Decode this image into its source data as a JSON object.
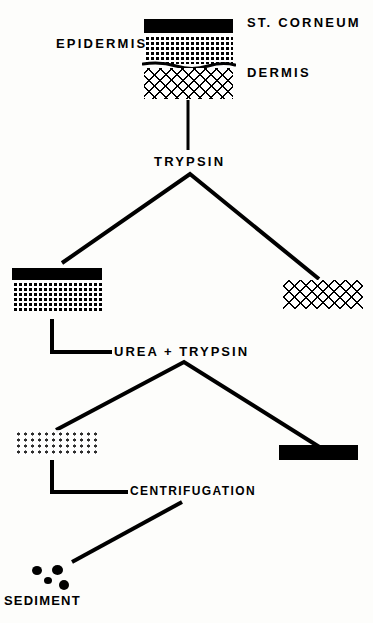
{
  "figure": {
    "type": "flow-diagram",
    "background_color": "#fdfdfb",
    "ink_color": "#000000"
  },
  "labels": {
    "st_corneum": "ST. CORNEUM",
    "epidermis": "EPIDERMIS",
    "dermis": "DERMIS",
    "trypsin": "TRYPSIN",
    "urea_trypsin": "UREA + TRYPSIN",
    "centrifugation": "CENTRIFUGATION",
    "sediment": "SEDIMENT"
  },
  "specimens": {
    "skin_full": {
      "name": "full-thickness-skin",
      "layers": [
        "stratum corneum (solid black)",
        "epidermis (dotted)",
        "dermis (cross-hatched)"
      ]
    },
    "epidermis_sheet": {
      "name": "separated-epidermis",
      "layers": [
        "stratum corneum (solid black)",
        "epidermis (dotted)"
      ]
    },
    "dermis_block": {
      "name": "separated-dermis",
      "layers": [
        "dermis (cross-hatched)"
      ]
    },
    "dissociated_cells": {
      "name": "dissociated-epidermal-cells",
      "layers": [
        "loose dotted cells"
      ]
    },
    "corneum_sheet": {
      "name": "stratum-corneum-sheet",
      "layers": [
        "stratum corneum (solid black)"
      ]
    },
    "sediment_pellet": {
      "name": "sediment-pellet",
      "dot_count": 5
    }
  },
  "steps": [
    {
      "step": 1,
      "reagent": "TRYPSIN",
      "input": "full-thickness-skin",
      "outputs": [
        "separated-epidermis",
        "separated-dermis"
      ]
    },
    {
      "step": 2,
      "reagent": "UREA + TRYPSIN",
      "input": "separated-epidermis",
      "outputs": [
        "dissociated-epidermal-cells",
        "stratum-corneum-sheet"
      ]
    },
    {
      "step": 3,
      "reagent": "CENTRIFUGATION",
      "input": "dissociated-epidermal-cells",
      "outputs": [
        "sediment-pellet"
      ]
    }
  ]
}
